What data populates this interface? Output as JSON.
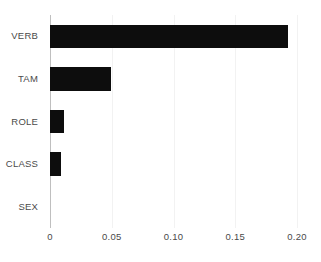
{
  "chart_data": {
    "type": "bar",
    "orientation": "horizontal",
    "title": "",
    "subtitle": "",
    "xlabel": "",
    "ylabel": "",
    "categories": [
      "VERB",
      "TAM",
      "ROLE",
      "CLASS",
      "SEX"
    ],
    "values": [
      0.193,
      0.049,
      0.011,
      0.009,
      0.0
    ],
    "series": [
      {
        "name": "",
        "values": [
          0.193,
          0.049,
          0.011,
          0.009,
          0.0
        ]
      }
    ],
    "xlim": [
      0,
      0.2
    ],
    "xticks": [
      0,
      0.05,
      0.1,
      0.15,
      0.2
    ],
    "xtick_labels": [
      "0",
      "0.05",
      "0.10",
      "0.15",
      "0.20"
    ],
    "yticks": [
      "VERB",
      "TAM",
      "ROLE",
      "CLASS",
      "SEX"
    ],
    "grid": true,
    "grid_axis": "x",
    "legend": false,
    "legend_position": "none",
    "annotations": [],
    "colors": {
      "bar": "#0d0d0d",
      "gridline": "#f2f2f2",
      "axis": "#bfbfbf",
      "text": "#4a4a4a",
      "background": "#ffffff"
    }
  }
}
